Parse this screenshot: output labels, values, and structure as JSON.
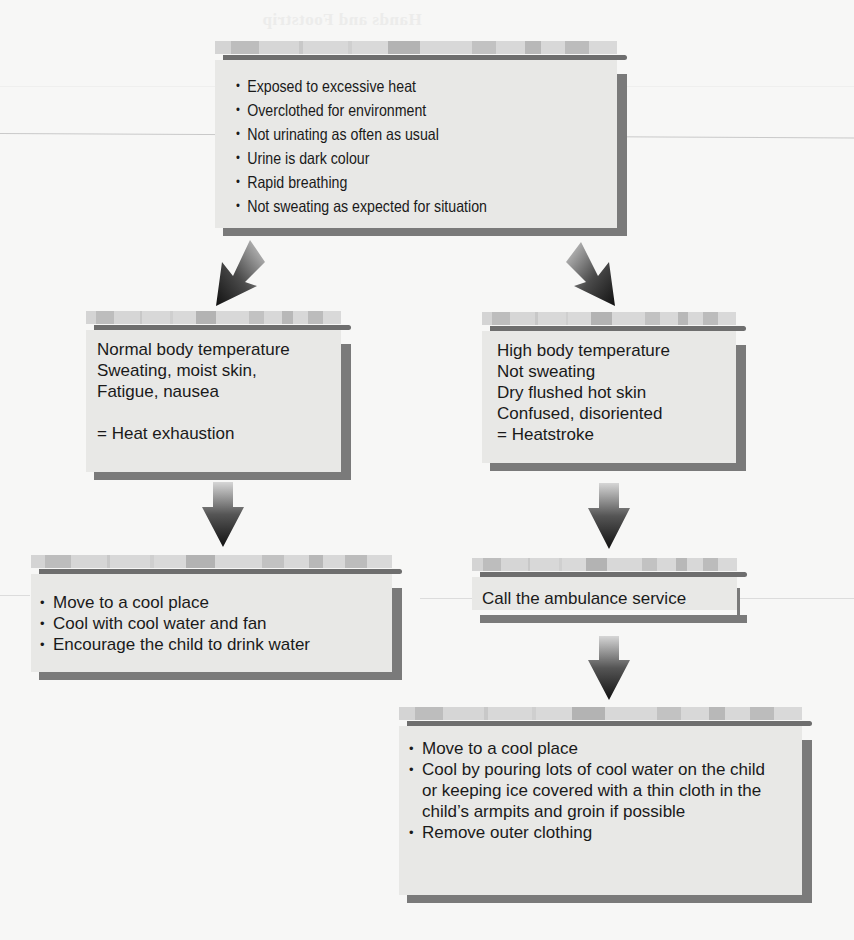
{
  "background": {
    "ghost_text": "Hands and Footstrip",
    "colors": {
      "page": "#f7f7f6",
      "box": "#e8e8e6",
      "shadow": "#7a7a7a",
      "bar": "#6e6e6e"
    }
  },
  "symptoms": {
    "items": [
      "Exposed to excessive heat",
      "Overclothed for environment",
      "Not urinating as often as usual",
      "Urine is dark colour",
      "Rapid breathing",
      "Not sweating as expected for situation"
    ]
  },
  "heat_exhaustion": {
    "lines": [
      "Normal body temperature",
      "Sweating, moist skin,",
      "Fatigue, nausea"
    ],
    "diagnosis": "= Heat exhaustion"
  },
  "heatstroke": {
    "lines": [
      "High body temperature",
      "Not sweating",
      "Dry flushed hot skin",
      "Confused, disoriented"
    ],
    "diagnosis": "= Heatstroke"
  },
  "exhaustion_treatment": {
    "items": [
      "Move to a cool place",
      "Cool with cool water and fan",
      "Encourage the child to drink water"
    ]
  },
  "call": {
    "label": "Call the ambulance service"
  },
  "heatstroke_treatment": {
    "items": [
      "Move to a cool place",
      "Cool by pouring lots of cool water on the child or keeping ice covered with a thin cloth in the child’s armpits and groin if possible",
      "Remove outer clothing"
    ]
  },
  "arrows": [
    {
      "name": "arrow-to-heat-exhaustion",
      "direction": "down-left"
    },
    {
      "name": "arrow-to-heatstroke",
      "direction": "down-right"
    },
    {
      "name": "arrow-to-exhaustion-treatment",
      "direction": "down"
    },
    {
      "name": "arrow-to-call-ambulance",
      "direction": "down"
    },
    {
      "name": "arrow-to-heatstroke-treatment",
      "direction": "down"
    }
  ]
}
